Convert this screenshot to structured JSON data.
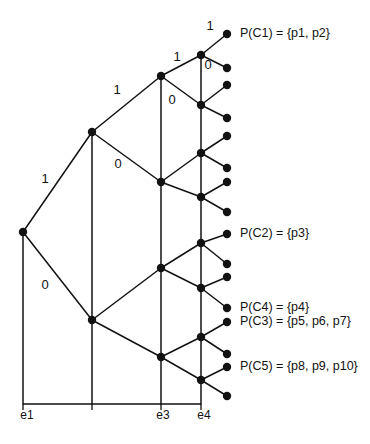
{
  "figure": {
    "title": "",
    "background_color": "#ffffff",
    "ink_color": "#121212"
  },
  "axis": {
    "baseline_y": 404,
    "ticks": [
      {
        "id": "e1",
        "label": "e1",
        "x": 23,
        "label_x": 27,
        "label_y": 419
      },
      {
        "id": "e2",
        "label": "",
        "x": 92,
        "label_x": 92,
        "label_y": 419
      },
      {
        "id": "e3",
        "label": "e3",
        "x": 161,
        "label_x": 163,
        "label_y": 419
      },
      {
        "id": "e4",
        "label": "e4",
        "x": 201,
        "label_x": 204,
        "label_y": 419
      }
    ]
  },
  "nodes": [
    {
      "id": "root",
      "x": 23,
      "y": 232,
      "r": 4.2
    },
    {
      "id": "n1",
      "x": 92,
      "y": 132,
      "r": 4.2
    },
    {
      "id": "n0",
      "x": 92,
      "y": 320,
      "r": 4.2
    },
    {
      "id": "n11",
      "x": 161,
      "y": 76,
      "r": 4.2
    },
    {
      "id": "n10",
      "x": 161,
      "y": 182,
      "r": 4.2
    },
    {
      "id": "n01",
      "x": 161,
      "y": 268,
      "r": 4.2
    },
    {
      "id": "n00",
      "x": 161,
      "y": 357,
      "r": 4.2
    },
    {
      "id": "n111",
      "x": 201,
      "y": 55,
      "r": 4.2
    },
    {
      "id": "n110",
      "x": 201,
      "y": 105,
      "r": 4.2
    },
    {
      "id": "n101",
      "x": 201,
      "y": 153,
      "r": 4.2
    },
    {
      "id": "n100",
      "x": 201,
      "y": 197,
      "r": 4.2
    },
    {
      "id": "n011",
      "x": 201,
      "y": 243,
      "r": 4.2
    },
    {
      "id": "n010",
      "x": 201,
      "y": 288,
      "r": 4.2
    },
    {
      "id": "n001",
      "x": 201,
      "y": 337,
      "r": 4.2
    },
    {
      "id": "n000",
      "x": 201,
      "y": 380,
      "r": 4.2
    }
  ],
  "leaves": [
    {
      "id": "l1",
      "x": 227,
      "y": 34,
      "r": 4.2
    },
    {
      "id": "l2",
      "x": 227,
      "y": 68,
      "r": 4.2
    },
    {
      "id": "l3",
      "x": 227,
      "y": 85,
      "r": 4.2
    },
    {
      "id": "l4",
      "x": 227,
      "y": 118,
      "r": 4.2
    },
    {
      "id": "l5",
      "x": 227,
      "y": 136,
      "r": 4.2
    },
    {
      "id": "l6",
      "x": 227,
      "y": 168,
      "r": 4.2
    },
    {
      "id": "l7",
      "x": 227,
      "y": 182,
      "r": 4.2
    },
    {
      "id": "l8",
      "x": 227,
      "y": 212,
      "r": 4.2
    },
    {
      "id": "l9",
      "x": 227,
      "y": 234,
      "r": 4.2
    },
    {
      "id": "l10",
      "x": 227,
      "y": 264,
      "r": 4.2
    },
    {
      "id": "l11",
      "x": 227,
      "y": 277,
      "r": 4.2
    },
    {
      "id": "l12",
      "x": 227,
      "y": 308,
      "r": 4.2
    },
    {
      "id": "l13",
      "x": 227,
      "y": 322,
      "r": 4.2
    },
    {
      "id": "l14",
      "x": 227,
      "y": 354,
      "r": 4.2
    },
    {
      "id": "l15",
      "x": 227,
      "y": 367,
      "r": 4.2
    },
    {
      "id": "l16",
      "x": 227,
      "y": 396,
      "r": 4.2
    }
  ],
  "edges": [
    {
      "id": "root-n1",
      "x1": 23,
      "y1": 232,
      "x2": 92,
      "y2": 132
    },
    {
      "id": "root-n0",
      "x1": 23,
      "y1": 232,
      "x2": 92,
      "y2": 320
    },
    {
      "id": "n1-n11",
      "x1": 92,
      "y1": 132,
      "x2": 161,
      "y2": 76
    },
    {
      "id": "n1-n10",
      "x1": 92,
      "y1": 132,
      "x2": 161,
      "y2": 182
    },
    {
      "id": "n0-n01",
      "x1": 92,
      "y1": 320,
      "x2": 161,
      "y2": 268
    },
    {
      "id": "n0-n00",
      "x1": 92,
      "y1": 320,
      "x2": 161,
      "y2": 357
    },
    {
      "id": "n11-n111",
      "x1": 161,
      "y1": 76,
      "x2": 201,
      "y2": 55
    },
    {
      "id": "n11-n110",
      "x1": 161,
      "y1": 76,
      "x2": 201,
      "y2": 105
    },
    {
      "id": "n10-n101",
      "x1": 161,
      "y1": 182,
      "x2": 201,
      "y2": 153
    },
    {
      "id": "n10-n100",
      "x1": 161,
      "y1": 182,
      "x2": 201,
      "y2": 197
    },
    {
      "id": "n01-n011",
      "x1": 161,
      "y1": 268,
      "x2": 201,
      "y2": 243
    },
    {
      "id": "n01-n010",
      "x1": 161,
      "y1": 268,
      "x2": 201,
      "y2": 288
    },
    {
      "id": "n00-n001",
      "x1": 161,
      "y1": 357,
      "x2": 201,
      "y2": 337
    },
    {
      "id": "n00-n000",
      "x1": 161,
      "y1": 357,
      "x2": 201,
      "y2": 380
    },
    {
      "id": "n111-l1",
      "x1": 201,
      "y1": 55,
      "x2": 227,
      "y2": 34
    },
    {
      "id": "n111-l2",
      "x1": 201,
      "y1": 55,
      "x2": 227,
      "y2": 68
    },
    {
      "id": "n110-l3",
      "x1": 201,
      "y1": 105,
      "x2": 227,
      "y2": 85
    },
    {
      "id": "n110-l4",
      "x1": 201,
      "y1": 105,
      "x2": 227,
      "y2": 118
    },
    {
      "id": "n101-l5",
      "x1": 201,
      "y1": 153,
      "x2": 227,
      "y2": 136
    },
    {
      "id": "n101-l6",
      "x1": 201,
      "y1": 153,
      "x2": 227,
      "y2": 168
    },
    {
      "id": "n100-l7",
      "x1": 201,
      "y1": 197,
      "x2": 227,
      "y2": 182
    },
    {
      "id": "n100-l8",
      "x1": 201,
      "y1": 197,
      "x2": 227,
      "y2": 212
    },
    {
      "id": "n011-l9",
      "x1": 201,
      "y1": 243,
      "x2": 227,
      "y2": 234
    },
    {
      "id": "n011-l10",
      "x1": 201,
      "y1": 243,
      "x2": 227,
      "y2": 264
    },
    {
      "id": "n010-l11",
      "x1": 201,
      "y1": 288,
      "x2": 227,
      "y2": 277
    },
    {
      "id": "n010-l12",
      "x1": 201,
      "y1": 288,
      "x2": 227,
      "y2": 308
    },
    {
      "id": "n001-l13",
      "x1": 201,
      "y1": 337,
      "x2": 227,
      "y2": 322
    },
    {
      "id": "n001-l14",
      "x1": 201,
      "y1": 337,
      "x2": 227,
      "y2": 354
    },
    {
      "id": "n000-l15",
      "x1": 201,
      "y1": 380,
      "x2": 227,
      "y2": 367
    },
    {
      "id": "n000-l16",
      "x1": 201,
      "y1": 380,
      "x2": 227,
      "y2": 396
    }
  ],
  "verticals": [
    {
      "id": "v-e1",
      "x": 23,
      "y1": 232,
      "y2": 404
    },
    {
      "id": "v-e2",
      "x": 92,
      "y1": 132,
      "y2": 404
    },
    {
      "id": "v-e3",
      "x": 161,
      "y1": 76,
      "y2": 404
    },
    {
      "id": "v-e4",
      "x": 201,
      "y1": 55,
      "y2": 404
    }
  ],
  "edge_labels": [
    {
      "id": "lbl-root-1",
      "text": "1",
      "x": 45,
      "y": 180
    },
    {
      "id": "lbl-root-0",
      "text": "0",
      "x": 45,
      "y": 286
    },
    {
      "id": "lbl-n1-1",
      "text": "1",
      "x": 117,
      "y": 91
    },
    {
      "id": "lbl-n1-0",
      "text": "0",
      "x": 118,
      "y": 165
    },
    {
      "id": "lbl-n11-1",
      "text": "1",
      "x": 177,
      "y": 58
    },
    {
      "id": "lbl-n11-0",
      "text": "0",
      "x": 172,
      "y": 101
    },
    {
      "id": "lbl-n111-1",
      "text": "1",
      "x": 210,
      "y": 27
    },
    {
      "id": "lbl-n111-0",
      "text": "0",
      "x": 208,
      "y": 66
    }
  ],
  "cluster_labels": [
    {
      "id": "pc1",
      "text": "P(C1) = {p1, p2}",
      "x": 240,
      "y": 34
    },
    {
      "id": "pc2",
      "text": "P(C2) = {p3}",
      "x": 240,
      "y": 234
    },
    {
      "id": "pc4",
      "text": "P(C4) = {p4}",
      "x": 240,
      "y": 308
    },
    {
      "id": "pc3",
      "text": "P(C3) = {p5, p6, p7}",
      "x": 240,
      "y": 322
    },
    {
      "id": "pc5",
      "text": "P(C5) = {p8, p9, p10}",
      "x": 240,
      "y": 367
    }
  ]
}
